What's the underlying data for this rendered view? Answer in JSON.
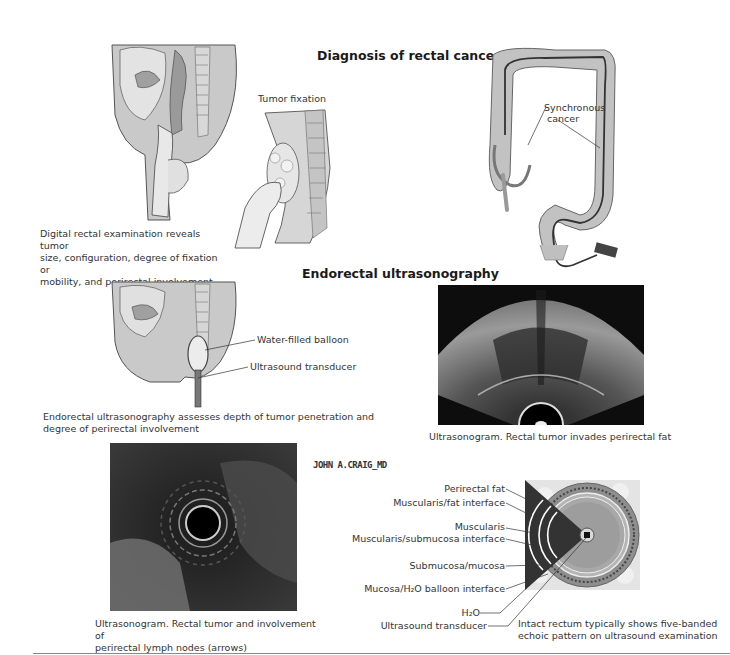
{
  "sections": {
    "diagnosis_title": "Diagnosis of rectal cancer",
    "endorectal_title": "Endorectal ultrasonography"
  },
  "panels": {
    "digital_exam": {
      "caption_lines": [
        "Digital rectal examination reveals tumor",
        "size, configuration, degree of fixation or",
        "mobility, and perirectal involvement"
      ]
    },
    "tumor_fixation": {
      "label": "Tumor fixation"
    },
    "colonoscopy": {
      "label_lines": [
        "Synchronous",
        "cancer"
      ]
    },
    "endorectal_probe": {
      "labels": [
        "Water-filled balloon",
        "Ultrasound transducer"
      ],
      "caption_lines": [
        "Endorectal ultrasonography assesses depth of tumor penetration and",
        "degree of perirectal involvement"
      ]
    },
    "ultrasonogram_fan": {
      "caption": "Ultrasonogram. Rectal tumor invades perirectal fat"
    },
    "ultrasonogram_radial": {
      "caption_lines": [
        "Ultrasonogram. Rectal tumor and involvement of",
        "perirectal lymph nodes (arrows)"
      ]
    },
    "five_band": {
      "labels": [
        "Perirectal fat",
        "Muscularis/fat interface",
        "Muscularis",
        "Muscularis/submucosa interface",
        "Submucosa/mucosa",
        "Mucosa/H₂O balloon interface",
        "H₂O",
        "Ultrasound transducer"
      ],
      "caption_lines": [
        "Intact rectum typically shows five-banded",
        "echoic pattern on ultrasound examination"
      ]
    }
  },
  "signature": "JOHN A.CRAIG_MD",
  "colors": {
    "ink": "#333333",
    "tissue": "#b8b8b8",
    "tissue_dark": "#7a7a7a",
    "ultrasound_bg": "#111111",
    "rule": "#888888"
  }
}
